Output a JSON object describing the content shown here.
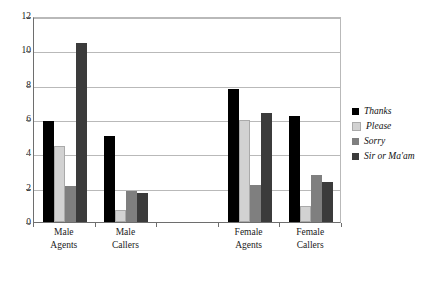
{
  "chart_data": {
    "type": "bar",
    "title": "",
    "xlabel": "",
    "ylabel": "",
    "ylim": [
      0,
      12
    ],
    "yticks": [
      0,
      2,
      4,
      6,
      8,
      10,
      12
    ],
    "grid": true,
    "legend_position": "right",
    "categories": [
      "Male Agents",
      "Male Callers",
      "",
      "Female Agents",
      "Female Callers"
    ],
    "category_lines": [
      [
        "Male",
        "Agents"
      ],
      [
        "Male",
        "Callers"
      ],
      [
        "",
        ""
      ],
      [
        "Female",
        "Agents"
      ],
      [
        "Female",
        "Callers"
      ]
    ],
    "series": [
      {
        "name": "Thanks",
        "color": "#000000",
        "values": [
          5.9,
          5.0,
          null,
          7.75,
          6.15
        ]
      },
      {
        "name": "Please",
        "color": "#d2d2d2",
        "values": [
          4.4,
          0.7,
          null,
          5.95,
          0.95
        ]
      },
      {
        "name": "Sorry",
        "color": "#7f7f7f",
        "values": [
          2.1,
          1.8,
          null,
          2.15,
          2.75
        ]
      },
      {
        "name": "Sir or Ma'am",
        "color": "#3b3b3b",
        "values": [
          10.4,
          1.7,
          null,
          6.35,
          2.35
        ]
      }
    ]
  },
  "axis": {
    "y_tick_labels": [
      "12",
      "10",
      "8",
      "6",
      "4",
      "2",
      "0"
    ]
  },
  "legend": {
    "items": [
      {
        "label": "Thanks",
        "swatch": "legend-swatch-thanks"
      },
      {
        "label": "Please",
        "swatch": "legend-swatch-please"
      },
      {
        "label": "Sorry",
        "swatch": "legend-swatch-sorry"
      },
      {
        "label": "Sir or Ma'am",
        "swatch": "legend-swatch-sir-or-maam"
      }
    ]
  }
}
